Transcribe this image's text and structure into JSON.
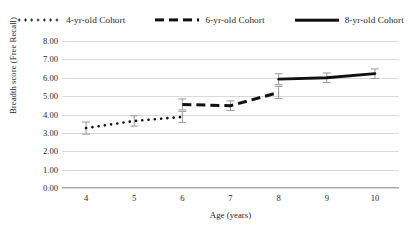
{
  "chart_data": {
    "type": "line",
    "title": "",
    "xlabel": "Age (years)",
    "ylabel": "Breadth score (Free Recall)",
    "x": [
      4,
      5,
      6,
      7,
      8,
      9,
      10
    ],
    "xticklabels": [
      "4",
      "5",
      "6",
      "7",
      "8",
      "9",
      "10"
    ],
    "yticklabels": [
      "0.00",
      "1.00",
      "2.00",
      "3.00",
      "4.00",
      "5.00",
      "6.00",
      "7.00",
      "8.00"
    ],
    "ylim": [
      0,
      8
    ],
    "ytick_step": 1,
    "grid": "horizontal",
    "legend_position": "top-center",
    "series": [
      {
        "name": "4-yr-old Cohort",
        "style": "dotted",
        "color": "#111111",
        "x": [
          4,
          5,
          6
        ],
        "values": [
          3.26,
          3.65,
          3.87
        ],
        "errors": [
          0.33,
          0.28,
          0.3
        ]
      },
      {
        "name": "6-yr-old Cohort",
        "style": "dashed",
        "color": "#111111",
        "x": [
          6,
          7,
          8
        ],
        "values": [
          4.55,
          4.48,
          5.2
        ],
        "errors": [
          0.3,
          0.26,
          0.33
        ]
      },
      {
        "name": "8-yr-old Cohort",
        "style": "solid",
        "color": "#111111",
        "x": [
          8,
          9,
          10
        ],
        "values": [
          5.92,
          6.0,
          6.22
        ],
        "errors": [
          0.3,
          0.26,
          0.26
        ]
      }
    ]
  },
  "legend": {
    "items": [
      {
        "label": "4-yr-old Cohort",
        "style": "dotted"
      },
      {
        "label": "6-yr-old Cohort",
        "style": "dashed"
      },
      {
        "label": "8-yr-old Cohort",
        "style": "solid"
      }
    ]
  },
  "axes": {
    "x_title": "Age (years)",
    "y_title": "Breadth score (Free Recall)"
  },
  "colors": {
    "series": "#111111",
    "gridline": "#dadada",
    "axis": "#a6a6a6",
    "error_bar": "#9a9a9a",
    "text": "#1f1f1f",
    "background": "#ffffff"
  }
}
